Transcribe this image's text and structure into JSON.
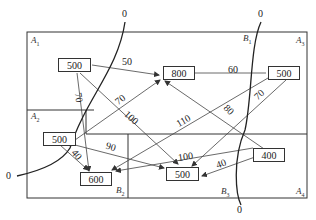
{
  "diagram": {
    "zones": [
      {
        "id": "A1",
        "letter": "A",
        "sub": "1"
      },
      {
        "id": "A2",
        "letter": "A",
        "sub": "2"
      },
      {
        "id": "A3",
        "letter": "A",
        "sub": "3"
      },
      {
        "id": "A4",
        "letter": "A",
        "sub": "4"
      },
      {
        "id": "B1",
        "letter": "B",
        "sub": "1"
      },
      {
        "id": "B2",
        "letter": "B",
        "sub": "2"
      },
      {
        "id": "B3",
        "letter": "B",
        "sub": "3"
      }
    ],
    "nodes": [
      {
        "id": "a1",
        "zone": "A1",
        "value": "500"
      },
      {
        "id": "b1",
        "zone": "B1",
        "value": "800"
      },
      {
        "id": "a3",
        "zone": "A3",
        "value": "500"
      },
      {
        "id": "a2",
        "zone": "A2",
        "value": "500"
      },
      {
        "id": "b2",
        "zone": "B2",
        "value": "600"
      },
      {
        "id": "b3",
        "zone": "B3",
        "value": "500"
      },
      {
        "id": "a4",
        "zone": "A4",
        "value": "400"
      }
    ],
    "edges": [
      {
        "from": "a1",
        "to": "b1",
        "label": "50"
      },
      {
        "from": "a1",
        "to": "b2",
        "label": "70"
      },
      {
        "from": "a1",
        "to": "b3",
        "label": "100"
      },
      {
        "from": "a2",
        "to": "b1",
        "label": "70"
      },
      {
        "from": "a2",
        "to": "b2",
        "label": "40"
      },
      {
        "from": "a2",
        "to": "b3",
        "label": "90"
      },
      {
        "from": "a3",
        "to": "b1",
        "label": "60"
      },
      {
        "from": "a3",
        "to": "b2",
        "label": "110"
      },
      {
        "from": "a3",
        "to": "b3",
        "label": "70"
      },
      {
        "from": "a4",
        "to": "b1",
        "label": "80"
      },
      {
        "from": "a4",
        "to": "b2",
        "label": "100"
      },
      {
        "from": "a4",
        "to": "b3",
        "label": "40"
      }
    ],
    "cut_lines": [
      {
        "id": "cut-left",
        "end_labels": [
          "0",
          "0"
        ]
      },
      {
        "id": "cut-right",
        "end_labels": [
          "0",
          "0"
        ]
      }
    ]
  }
}
